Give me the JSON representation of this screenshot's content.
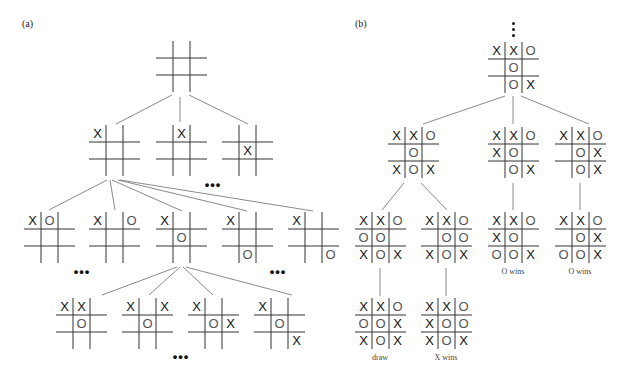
{
  "figure": {
    "panels": [
      {
        "id": "a",
        "label": "(a)",
        "x": 22,
        "y": 18
      },
      {
        "id": "b",
        "label": "(b)",
        "x": 355,
        "y": 18
      }
    ],
    "boards": [
      {
        "id": "a-root",
        "panel": "a",
        "x": 156,
        "y": 41,
        "cells": [
          "",
          "",
          "",
          "",
          "",
          "",
          "",
          "",
          ""
        ]
      },
      {
        "id": "a-l1-1",
        "panel": "a",
        "x": 89,
        "y": 125,
        "cells": [
          "X",
          "",
          "",
          "",
          "",
          "",
          "",
          "",
          ""
        ]
      },
      {
        "id": "a-l1-2",
        "panel": "a",
        "x": 156,
        "y": 125,
        "cells": [
          "",
          "X",
          "",
          "",
          "",
          "",
          "",
          "",
          ""
        ]
      },
      {
        "id": "a-l1-3",
        "panel": "a",
        "x": 222,
        "y": 125,
        "cells": [
          "",
          "",
          "",
          "",
          "X",
          "",
          "",
          "",
          ""
        ]
      },
      {
        "id": "a-l2-1",
        "panel": "a",
        "x": 24,
        "y": 212,
        "cells": [
          "X",
          "O",
          "",
          "",
          "",
          "",
          "",
          "",
          ""
        ]
      },
      {
        "id": "a-l2-2",
        "panel": "a",
        "x": 89,
        "y": 212,
        "cells": [
          "X",
          "",
          "O",
          "",
          "",
          "",
          "",
          "",
          ""
        ]
      },
      {
        "id": "a-l2-3",
        "panel": "a",
        "x": 156,
        "y": 212,
        "cells": [
          "X",
          "",
          "",
          "",
          "O",
          "",
          "",
          "",
          ""
        ]
      },
      {
        "id": "a-l2-4",
        "panel": "a",
        "x": 222,
        "y": 212,
        "cells": [
          "X",
          "",
          "",
          "",
          "",
          "",
          "",
          "O",
          ""
        ]
      },
      {
        "id": "a-l2-5",
        "panel": "a",
        "x": 288,
        "y": 212,
        "cells": [
          "X",
          "",
          "",
          "",
          "",
          "",
          "",
          "",
          "O"
        ]
      },
      {
        "id": "a-l3-1",
        "panel": "a",
        "x": 56,
        "y": 298,
        "cells": [
          "X",
          "X",
          "",
          "",
          "O",
          "",
          "",
          "",
          ""
        ]
      },
      {
        "id": "a-l3-2",
        "panel": "a",
        "x": 122,
        "y": 298,
        "cells": [
          "X",
          "",
          "X",
          "",
          "O",
          "",
          "",
          "",
          ""
        ]
      },
      {
        "id": "a-l3-3",
        "panel": "a",
        "x": 188,
        "y": 298,
        "cells": [
          "X",
          "",
          "",
          "",
          "O",
          "X",
          "",
          "",
          ""
        ]
      },
      {
        "id": "a-l3-4",
        "panel": "a",
        "x": 254,
        "y": 298,
        "cells": [
          "X",
          "",
          "",
          "",
          "O",
          "",
          "",
          "",
          "X"
        ]
      },
      {
        "id": "b-root",
        "panel": "b",
        "x": 488,
        "y": 42,
        "cells": [
          "X",
          "X",
          "O",
          "",
          "O",
          "",
          "",
          "O",
          "X"
        ]
      },
      {
        "id": "b-l1-1",
        "panel": "b",
        "x": 388,
        "y": 127,
        "cells": [
          "X",
          "X",
          "O",
          "",
          "O",
          "",
          "X",
          "O",
          "X"
        ]
      },
      {
        "id": "b-l1-2",
        "panel": "b",
        "x": 488,
        "y": 127,
        "cells": [
          "X",
          "X",
          "O",
          "X",
          "O",
          "",
          "",
          "O",
          "X"
        ]
      },
      {
        "id": "b-l1-3",
        "panel": "b",
        "x": 555,
        "y": 127,
        "cells": [
          "X",
          "X",
          "O",
          "",
          "O",
          "X",
          "",
          "O",
          "X"
        ]
      },
      {
        "id": "b-l2-1",
        "panel": "b",
        "x": 355,
        "y": 212,
        "cells": [
          "X",
          "X",
          "O",
          "O",
          "O",
          "",
          "X",
          "O",
          "X"
        ]
      },
      {
        "id": "b-l2-2",
        "panel": "b",
        "x": 421,
        "y": 212,
        "cells": [
          "X",
          "X",
          "O",
          "",
          "O",
          "O",
          "X",
          "O",
          "X"
        ]
      },
      {
        "id": "b-l2-3",
        "panel": "b",
        "x": 488,
        "y": 212,
        "cells": [
          "X",
          "X",
          "O",
          "X",
          "O",
          "",
          "O",
          "O",
          "X"
        ]
      },
      {
        "id": "b-l2-4",
        "panel": "b",
        "x": 555,
        "y": 212,
        "cells": [
          "X",
          "X",
          "O",
          "",
          "O",
          "X",
          "O",
          "O",
          "X"
        ]
      },
      {
        "id": "b-l3-1",
        "panel": "b",
        "x": 355,
        "y": 298,
        "cells": [
          "X",
          "X",
          "O",
          "O",
          "O",
          "X",
          "X",
          "O",
          "X"
        ]
      },
      {
        "id": "b-l3-2",
        "panel": "b",
        "x": 421,
        "y": 298,
        "cells": [
          "X",
          "X",
          "O",
          "X",
          "O",
          "O",
          "X",
          "O",
          "X"
        ]
      }
    ],
    "edges": [
      {
        "x1": 172,
        "y1": 95,
        "x2": 116,
        "y2": 124
      },
      {
        "x1": 180,
        "y1": 97,
        "x2": 180,
        "y2": 122
      },
      {
        "x1": 189,
        "y1": 95,
        "x2": 248,
        "y2": 124
      },
      {
        "x1": 107,
        "y1": 180,
        "x2": 49,
        "y2": 210
      },
      {
        "x1": 110,
        "y1": 180,
        "x2": 115,
        "y2": 210
      },
      {
        "x1": 112,
        "y1": 180,
        "x2": 182,
        "y2": 211
      },
      {
        "x1": 118,
        "y1": 180,
        "x2": 247,
        "y2": 211
      },
      {
        "x1": 120,
        "y1": 180,
        "x2": 313,
        "y2": 211
      },
      {
        "x1": 177,
        "y1": 267,
        "x2": 102,
        "y2": 295
      },
      {
        "x1": 180,
        "y1": 267,
        "x2": 149,
        "y2": 295
      },
      {
        "x1": 183,
        "y1": 267,
        "x2": 213,
        "y2": 295
      },
      {
        "x1": 186,
        "y1": 267,
        "x2": 292,
        "y2": 295
      },
      {
        "x1": 505,
        "y1": 96,
        "x2": 423,
        "y2": 124
      },
      {
        "x1": 513,
        "y1": 96,
        "x2": 513,
        "y2": 124
      },
      {
        "x1": 521,
        "y1": 96,
        "x2": 589,
        "y2": 124
      },
      {
        "x1": 404,
        "y1": 183,
        "x2": 382,
        "y2": 210
      },
      {
        "x1": 421,
        "y1": 183,
        "x2": 447,
        "y2": 210
      },
      {
        "x1": 513,
        "y1": 183,
        "x2": 513,
        "y2": 210
      },
      {
        "x1": 580,
        "y1": 183,
        "x2": 580,
        "y2": 210
      },
      {
        "x1": 380,
        "y1": 268,
        "x2": 380,
        "y2": 296
      },
      {
        "x1": 446,
        "y1": 268,
        "x2": 446,
        "y2": 296
      }
    ],
    "ellipses": [
      {
        "id": "a-l1-more",
        "text": "•••",
        "x": 213,
        "y": 182
      },
      {
        "id": "a-l2-more-left",
        "text": "•••",
        "x": 82,
        "y": 269
      },
      {
        "id": "a-l2-more-right",
        "text": "•••",
        "x": 278,
        "y": 269
      },
      {
        "id": "a-l3-more",
        "text": "•••",
        "x": 181,
        "y": 354
      }
    ],
    "vdots": {
      "x": 512,
      "y": 22,
      "count": 3
    },
    "outcomes": [
      {
        "board": "b-l2-3",
        "text": "O wins",
        "x": 513,
        "y": 267
      },
      {
        "board": "b-l2-4",
        "text": "O wins",
        "x": 580,
        "y": 267
      },
      {
        "board": "b-l3-1",
        "text": "draw",
        "x": 380,
        "y": 353
      },
      {
        "board": "b-l3-2",
        "text": "X wins",
        "x": 446,
        "y": 353
      }
    ],
    "colors": {
      "grid": "#333333",
      "edge": "#8a8a8a",
      "x_mark": "#111111",
      "o_mark": "#555555"
    }
  }
}
